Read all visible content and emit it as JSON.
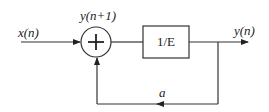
{
  "diagram": {
    "type": "block-diagram",
    "colors": {
      "line": "#333333",
      "text": "#222222",
      "background": "#ffffff"
    },
    "input_label": "x(n)",
    "summer_label": "y(n+1)",
    "summer_symbol": "+",
    "block_label": "1/E",
    "output_label": "y(n)",
    "feedback_label": "a"
  }
}
